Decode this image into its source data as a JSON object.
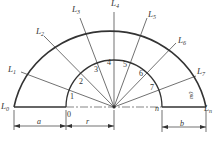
{
  "diagram": {
    "outer_labels": [
      "L0",
      "L1",
      "L2",
      "L3",
      "L4",
      "L5",
      "L6",
      "L7",
      "Ln"
    ],
    "inner_labels": [
      "0",
      "1",
      "2",
      "3",
      "4",
      "5",
      "6",
      "7",
      "n"
    ],
    "dimensions": {
      "a": "a",
      "r": "r",
      "b": "b"
    },
    "annotation": "m0",
    "colors": {
      "line": "#333333",
      "background": "#ffffff"
    }
  }
}
